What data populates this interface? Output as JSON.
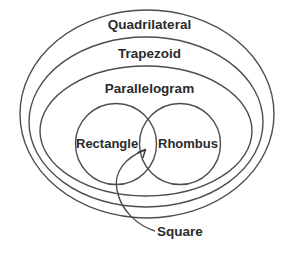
{
  "diagram": {
    "stroke_color": "#4d4d4d",
    "text_color": "#2b2b2b",
    "background_color": "#ffffff",
    "sets": [
      {
        "id": "quadrilateral",
        "label": "Quadrilateral",
        "shape": "ellipse",
        "level": 1,
        "center": [
          147,
          114
        ],
        "radius_x": 127,
        "radius_y": 104
      },
      {
        "id": "trapezoid",
        "label": "Trapezoid",
        "shape": "ellipse",
        "level": 2,
        "center": [
          146,
          122
        ],
        "radius_x": 117,
        "radius_y": 85
      },
      {
        "id": "parallelogram",
        "label": "Parallelogram",
        "shape": "ellipse",
        "level": 3,
        "center": [
          146,
          131
        ],
        "radius_x": 106,
        "radius_y": 65
      },
      {
        "id": "rectangle",
        "label": "Rectangle",
        "shape": "circle",
        "level": 4,
        "center": [
          116,
          144
        ],
        "radius_x": 41,
        "radius_y": 40
      },
      {
        "id": "rhombus",
        "label": "Rhombus",
        "shape": "circle",
        "level": 4,
        "center": [
          180,
          144
        ],
        "radius_x": 41,
        "radius_y": 40
      }
    ],
    "intersection": {
      "id": "square",
      "label": "Square",
      "of": [
        "rectangle",
        "rhombus"
      ],
      "callout_target": [
        147,
        149
      ]
    }
  }
}
